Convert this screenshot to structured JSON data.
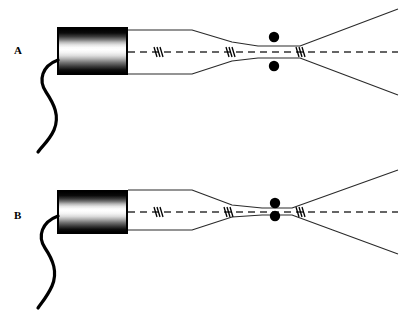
{
  "figure": {
    "background_color": "#ffffff",
    "stroke_color": "#000000",
    "width": 406,
    "height": 316
  },
  "panels": [
    {
      "id": "A",
      "label": "A",
      "label_x": 14,
      "label_y": 45,
      "source": {
        "name": "gradient-cylinder-source",
        "x": 57,
        "y": 27,
        "width": 71,
        "height": 48,
        "border_color": "#000000",
        "fill": "vertical-gradient-black-white-black"
      },
      "cable": {
        "name": "power-cable",
        "path": "M 58 60 C 42 66, 38 80, 46 92 C 54 104, 60 116, 54 130 C 49 141, 42 146, 38 152",
        "stroke_width": 3.2
      },
      "axis": {
        "name": "centerline-axis",
        "y": 52,
        "x_start": 128,
        "x_end": 398,
        "dash": "7,5",
        "stroke_width": 1.4
      },
      "flow_markers": [
        {
          "x": 158,
          "y": 52
        },
        {
          "x": 230,
          "y": 52
        },
        {
          "x": 300,
          "y": 52
        }
      ],
      "nozzle_upper": "M 128 30 L 192 30 L 232 42 L 258 46 L 300 46 L 398 9",
      "nozzle_lower": "M 128 74 L 192 74 L 232 61 L 258 58 L 300 58 L 398 95",
      "dots": [
        {
          "name": "probe-dot-upper",
          "cx": 274,
          "cy": 37,
          "r": 5.2
        },
        {
          "name": "probe-dot-lower",
          "cx": 274,
          "cy": 66,
          "r": 5.2
        }
      ]
    },
    {
      "id": "B",
      "label": "B",
      "label_x": 14,
      "label_y": 52,
      "source": {
        "name": "gradient-cylinder-source",
        "x": 57,
        "y": 32,
        "width": 71,
        "height": 44,
        "border_color": "#000000",
        "fill": "vertical-gradient-black-white-black"
      },
      "cable": {
        "name": "power-cable",
        "path": "M 58 58 C 42 64, 37 78, 45 90 C 53 102, 58 114, 52 128 C 47 139, 42 144, 38 150",
        "stroke_width": 3.2
      },
      "axis": {
        "name": "centerline-axis",
        "y": 54,
        "x_start": 128,
        "x_end": 398,
        "dash": "7,5",
        "stroke_width": 1.4
      },
      "flow_markers": [
        {
          "x": 158,
          "y": 54
        },
        {
          "x": 228,
          "y": 54
        },
        {
          "x": 300,
          "y": 54
        }
      ],
      "nozzle_upper": "M 128 32 L 192 32 L 232 47 L 262 50 L 292 50 L 398 12",
      "nozzle_lower": "M 128 72 L 192 72 L 232 59 L 262 57 L 292 57 L 398 96",
      "dots": [
        {
          "name": "probe-dot-upper",
          "cx": 275,
          "cy": 45,
          "r": 5.2
        },
        {
          "name": "probe-dot-lower",
          "cx": 275,
          "cy": 58,
          "r": 5.2
        }
      ]
    }
  ]
}
